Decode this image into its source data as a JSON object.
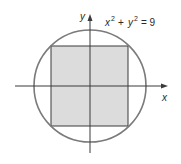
{
  "diagram": {
    "equation": {
      "x": "x",
      "y": "y",
      "exp": "2",
      "plus": "+",
      "equals": "= 9",
      "full": "x² + y² = 9"
    },
    "axes": {
      "x_label": "x",
      "y_label": "y"
    },
    "circle": {
      "radius": 3,
      "stroke": "#7a7a7a"
    },
    "square": {
      "description": "inscribed square",
      "fill": "#dcdcdc",
      "stroke": "#3a3a3a"
    },
    "colors": {
      "axis": "#3a3a3a",
      "circle": "#7a7a7a",
      "square_fill": "#dcdcdc",
      "text": "#2a2a2a"
    }
  }
}
